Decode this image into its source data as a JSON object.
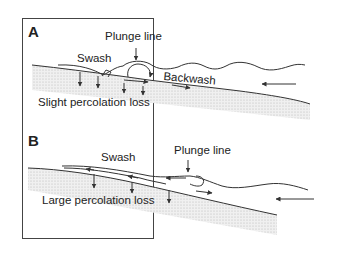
{
  "figure": {
    "panels": [
      {
        "id": "A",
        "letter": "A",
        "labels": {
          "plunge_line": "Plunge line",
          "swash": "Swash",
          "backwash": "Backwash",
          "percolation": "Slight percolation loss"
        }
      },
      {
        "id": "B",
        "letter": "B",
        "labels": {
          "plunge_line": "Plunge line",
          "swash": "Swash",
          "percolation": "Large percolation loss"
        }
      }
    ],
    "colors": {
      "line": "#333333",
      "sediment": "#e6e6e6",
      "border": "#444444",
      "background": "#ffffff"
    }
  }
}
